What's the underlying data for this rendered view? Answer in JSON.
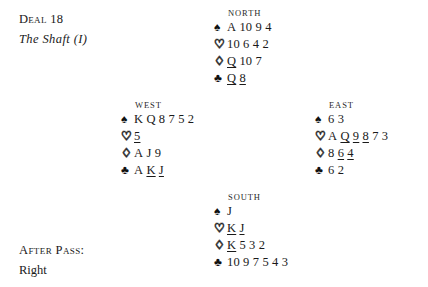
{
  "page": {
    "background": "#ffffff",
    "ink": "#1a1a1a"
  },
  "header": {
    "deal_title": "Deal 18",
    "deal_subtitle": "The Shaft (I)"
  },
  "footer": {
    "label": "After Pass:",
    "value": "Right"
  },
  "suit_symbols": {
    "spade": "♠",
    "heart": "♡",
    "diamond": "♢",
    "club": "♣"
  },
  "hands": {
    "north": {
      "label": "NORTH",
      "suits": [
        {
          "suit": "spade",
          "symbol": "♠",
          "color": "black",
          "cards": [
            {
              "rank": "A",
              "underlined": false
            },
            {
              "rank": "10",
              "underlined": false
            },
            {
              "rank": "9",
              "underlined": false
            },
            {
              "rank": "4",
              "underlined": false
            }
          ]
        },
        {
          "suit": "heart",
          "symbol": "♡",
          "color": "red",
          "cards": [
            {
              "rank": "10",
              "underlined": false
            },
            {
              "rank": "6",
              "underlined": false
            },
            {
              "rank": "4",
              "underlined": false
            },
            {
              "rank": "2",
              "underlined": false
            }
          ]
        },
        {
          "suit": "diamond",
          "symbol": "♢",
          "color": "red",
          "cards": [
            {
              "rank": "Q",
              "underlined": true
            },
            {
              "rank": "10",
              "underlined": false
            },
            {
              "rank": "7",
              "underlined": false
            }
          ]
        },
        {
          "suit": "club",
          "symbol": "♣",
          "color": "black",
          "cards": [
            {
              "rank": "Q",
              "underlined": true
            },
            {
              "rank": "8",
              "underlined": true
            }
          ]
        }
      ]
    },
    "west": {
      "label": "WEST",
      "suits": [
        {
          "suit": "spade",
          "symbol": "♠",
          "color": "black",
          "cards": [
            {
              "rank": "K",
              "underlined": false
            },
            {
              "rank": "Q",
              "underlined": false
            },
            {
              "rank": "8",
              "underlined": false
            },
            {
              "rank": "7",
              "underlined": false
            },
            {
              "rank": "5",
              "underlined": false
            },
            {
              "rank": "2",
              "underlined": false
            }
          ]
        },
        {
          "suit": "heart",
          "symbol": "♡",
          "color": "red",
          "cards": [
            {
              "rank": "5",
              "underlined": true
            }
          ]
        },
        {
          "suit": "diamond",
          "symbol": "♢",
          "color": "red",
          "cards": [
            {
              "rank": "A",
              "underlined": false
            },
            {
              "rank": "J",
              "underlined": false
            },
            {
              "rank": "9",
              "underlined": false
            }
          ]
        },
        {
          "suit": "club",
          "symbol": "♣",
          "color": "black",
          "cards": [
            {
              "rank": "A",
              "underlined": false
            },
            {
              "rank": "K",
              "underlined": true
            },
            {
              "rank": "J",
              "underlined": true
            }
          ]
        }
      ]
    },
    "east": {
      "label": "EAST",
      "suits": [
        {
          "suit": "spade",
          "symbol": "♠",
          "color": "black",
          "cards": [
            {
              "rank": "6",
              "underlined": false
            },
            {
              "rank": "3",
              "underlined": false
            }
          ]
        },
        {
          "suit": "heart",
          "symbol": "♡",
          "color": "red",
          "cards": [
            {
              "rank": "A",
              "underlined": false
            },
            {
              "rank": "Q",
              "underlined": true
            },
            {
              "rank": "9",
              "underlined": true
            },
            {
              "rank": "8",
              "underlined": true
            },
            {
              "rank": "7",
              "underlined": false
            },
            {
              "rank": "3",
              "underlined": false
            }
          ]
        },
        {
          "suit": "diamond",
          "symbol": "♢",
          "color": "red",
          "cards": [
            {
              "rank": "8",
              "underlined": false
            },
            {
              "rank": "6",
              "underlined": true
            },
            {
              "rank": "4",
              "underlined": true
            }
          ]
        },
        {
          "suit": "club",
          "symbol": "♣",
          "color": "black",
          "cards": [
            {
              "rank": "6",
              "underlined": false
            },
            {
              "rank": "2",
              "underlined": false
            }
          ]
        }
      ]
    },
    "south": {
      "label": "SOUTH",
      "suits": [
        {
          "suit": "spade",
          "symbol": "♠",
          "color": "black",
          "cards": [
            {
              "rank": "J",
              "underlined": false
            }
          ]
        },
        {
          "suit": "heart",
          "symbol": "♡",
          "color": "red",
          "cards": [
            {
              "rank": "K",
              "underlined": true
            },
            {
              "rank": "J",
              "underlined": true
            }
          ]
        },
        {
          "suit": "diamond",
          "symbol": "♢",
          "color": "red",
          "cards": [
            {
              "rank": "K",
              "underlined": true
            },
            {
              "rank": "5",
              "underlined": false
            },
            {
              "rank": "3",
              "underlined": false
            },
            {
              "rank": "2",
              "underlined": false
            }
          ]
        },
        {
          "suit": "club",
          "symbol": "♣",
          "color": "black",
          "cards": [
            {
              "rank": "10",
              "underlined": false
            },
            {
              "rank": "9",
              "underlined": false
            },
            {
              "rank": "7",
              "underlined": false
            },
            {
              "rank": "5",
              "underlined": false
            },
            {
              "rank": "4",
              "underlined": false
            },
            {
              "rank": "3",
              "underlined": false
            }
          ]
        }
      ]
    }
  }
}
